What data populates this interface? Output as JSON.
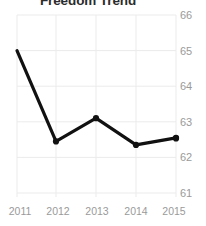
{
  "chart_data": {
    "type": "line",
    "title": "Freedom Trend",
    "xlabel": "",
    "ylabel": "",
    "categories": [
      "2011",
      "2012",
      "2013",
      "2014",
      "2015"
    ],
    "values": [
      65.0,
      62.45,
      63.1,
      62.35,
      62.55
    ],
    "series": [
      {
        "name": "Freedom Score",
        "values": [
          65.0,
          62.45,
          63.1,
          62.35,
          62.55
        ]
      }
    ],
    "x_tick_labels": [
      "2011",
      "2012",
      "2013",
      "2014",
      "2015"
    ],
    "y_tick_labels": [
      "61",
      "62",
      "63",
      "64",
      "65",
      "66"
    ],
    "y_ticks": [
      61,
      62,
      63,
      64,
      65,
      66
    ],
    "ylim": [
      61,
      66
    ],
    "grid": true,
    "grid_axis": "both",
    "legend": false,
    "legend_position": "none",
    "marker": "circle",
    "line_color": "#111111",
    "marker_color": "#111111",
    "grid_color": "#ebebeb",
    "tick_label_color": "#9a9a9a",
    "title_color": "#2b2b2b",
    "background_color": "#ffffff",
    "y_axis_position": "right"
  }
}
